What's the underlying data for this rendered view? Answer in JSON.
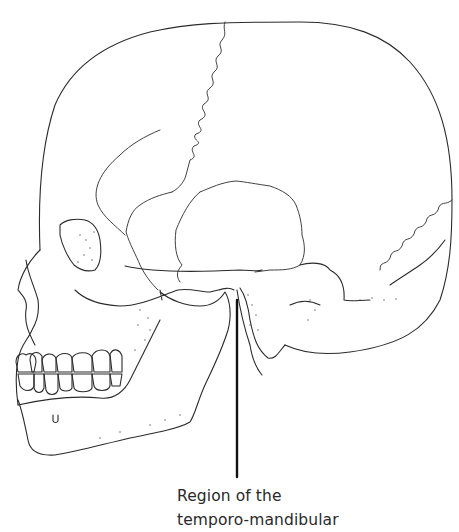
{
  "figure": {
    "line_color": "#2b2b2b",
    "background": "#ffffff"
  },
  "annotation": {
    "line1": "Region of the",
    "line2": "temporo-mandibular",
    "leader_line": {
      "x": 237,
      "y_start": 300,
      "y_end": 477
    }
  }
}
